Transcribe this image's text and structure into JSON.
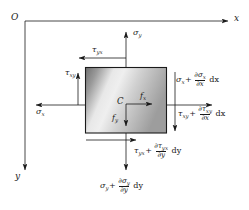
{
  "figure": {
    "type": "free-body-diagram",
    "axes": {
      "origin_label": "O",
      "x_label": "x",
      "y_label": "y",
      "x_direction": "right",
      "y_direction": "down"
    },
    "element": {
      "center_label": "C",
      "shape": "rectangle",
      "fill": "gray-gradient",
      "stroke_color": "#1a1a1a"
    },
    "body_forces": [
      {
        "name": "fx",
        "base": "f",
        "sub": "x",
        "direction": "right"
      },
      {
        "name": "fy",
        "base": "f",
        "sub": "y",
        "direction": "down"
      }
    ],
    "stresses": {
      "top_normal": {
        "base": "σ",
        "sub": "y",
        "direction": "up"
      },
      "top_shear": {
        "base": "τ",
        "sub": "yx",
        "direction": "left"
      },
      "left_normal": {
        "base": "σ",
        "sub": "x",
        "direction": "left"
      },
      "left_shear": {
        "base": "τ",
        "sub": "xy",
        "direction": "up"
      },
      "right_normal": {
        "base": "σ",
        "sub": "x",
        "plus": "+",
        "partial_num_sym": "∂σ",
        "partial_num_sub": "x",
        "partial_den_sym": "∂x",
        "differential": "dx",
        "direction": "right"
      },
      "right_shear": {
        "base": "τ",
        "sub": "xy",
        "plus": "+",
        "partial_num_sym": "∂τ",
        "partial_num_sub": "xy",
        "partial_den_sym": "∂x",
        "differential": "dx",
        "direction": "down"
      },
      "bottom_shear": {
        "base": "τ",
        "sub": "yx",
        "plus": "+",
        "partial_num_sym": "∂τ",
        "partial_num_sub": "yx",
        "partial_den_sym": "∂y",
        "differential": "dy",
        "direction": "right"
      },
      "bottom_normal": {
        "base": "σ",
        "sub": "y",
        "plus": "+",
        "partial_num_sym": "∂σ",
        "partial_num_sub": "y",
        "partial_den_sym": "∂y",
        "differential": "dy",
        "direction": "down"
      }
    },
    "colors": {
      "line": "#1a1a1a",
      "background": "#ffffff",
      "fill_dark": "#6e6e6e",
      "fill_light": "#f2f2f2"
    }
  }
}
